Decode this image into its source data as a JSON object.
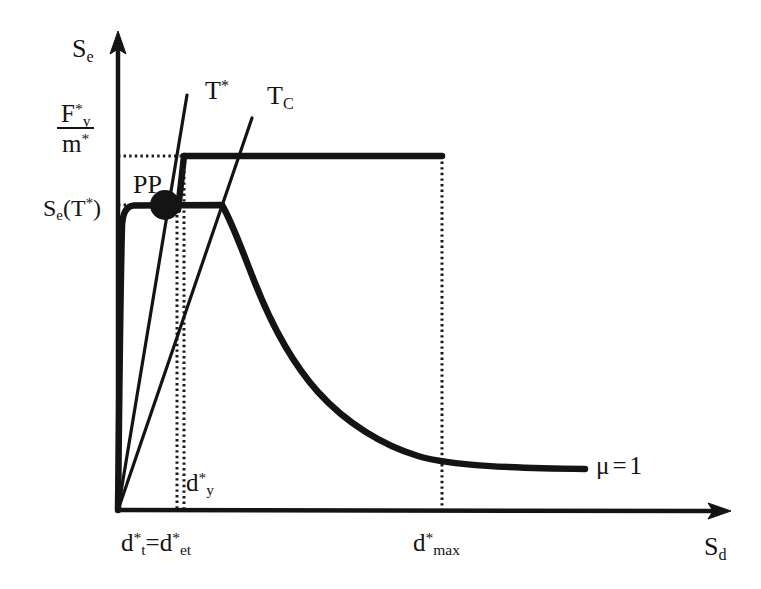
{
  "figure": {
    "background_color": "#ffffff",
    "line_color": "#141414",
    "axes": {
      "y_axis_label": "S_e",
      "x_axis_label": "S_d",
      "origin_px": {
        "x": 118,
        "y": 510
      },
      "y_axis_top_px": 33,
      "x_axis_right_px": 730
    },
    "labels": {
      "y_axis": {
        "base": "S",
        "sub": "e"
      },
      "x_axis": {
        "base": "S",
        "sub": "d"
      },
      "fy_over_m": {
        "numerator": {
          "base": "F",
          "sub": "y",
          "sup": "*"
        },
        "denominator": {
          "base": "m",
          "sup": "*"
        }
      },
      "se_of_tstar": {
        "text": "S_e(T*)",
        "base": "S",
        "sub": "e",
        "arg_base": "T",
        "arg_sup": "*"
      },
      "period_tstar": {
        "base": "T",
        "sup": "*"
      },
      "period_tc": {
        "base": "T",
        "sub": "C"
      },
      "performance_point": "PP",
      "d_y": {
        "base": "d",
        "sub": "y",
        "sup": "*"
      },
      "d_t_eq_d_et": {
        "left_base": "d",
        "left_sub": "t",
        "left_sup": "*",
        "eq": "=",
        "right_base": "d",
        "right_sub": "et",
        "right_sup": "*"
      },
      "d_max": {
        "base": "d",
        "sub": "max",
        "sup": "*"
      },
      "ductility": {
        "symbol": "μ",
        "relation": "=",
        "value": "1"
      }
    }
  },
  "chart_data": {
    "type": "line",
    "title": "",
    "xlabel": "S_d",
    "ylabel": "S_e",
    "grid": false,
    "legend": "none",
    "axis_ranges": {
      "x_px": [
        118,
        730
      ],
      "y_px": [
        510,
        33
      ]
    },
    "annotations": [
      {
        "name": "performance-point",
        "label": "PP",
        "x_px": 164,
        "y_px": 205,
        "marker": "filled-circle",
        "radius_px": 15
      },
      {
        "name": "ductility-label",
        "label": "μ = 1",
        "x_px": 596,
        "y_px": 453
      },
      {
        "name": "period-line-label-tstar",
        "label": "T*",
        "x_px": 205,
        "y_px": 78
      },
      {
        "name": "period-line-label-tc",
        "label": "TC",
        "x_px": 267,
        "y_px": 83
      }
    ],
    "reference_values_px": {
      "fy_over_m_level_y": 156,
      "se_tstar_level_y": 205,
      "d_t_eq_det_x": 177,
      "d_y_x": 184,
      "d_max_x": 442,
      "plateau_end_x": 222,
      "yield_knee_x": 124
    },
    "series": [
      {
        "name": "elastic-demand-spectrum-mu-1",
        "style": "thick-solid",
        "width_px": 6,
        "description": "Elastic acceleration demand spectrum for mu = 1: rises to the constant-acceleration plateau at Fy*/m*, then decays hyperbolically and flattens toward the right.",
        "points_px": [
          [
            118,
            510
          ],
          [
            120,
            330
          ],
          [
            122,
            230
          ],
          [
            124,
            170
          ],
          [
            130,
            157
          ],
          [
            160,
            156
          ],
          [
            230,
            156
          ],
          [
            300,
            156
          ],
          [
            380,
            156
          ],
          [
            442,
            156
          ]
        ]
      },
      {
        "name": "inelastic-demand-spectrum",
        "style": "thick-solid",
        "width_px": 6,
        "description": "Capacity (bilinear) / reduced demand curve: steep initial stiffness from origin to yield, constant plateau at S_e(T*), then descending branch decaying to a flat tail.",
        "points_px": [
          [
            118,
            510
          ],
          [
            121,
            380
          ],
          [
            123,
            280
          ],
          [
            126,
            215
          ],
          [
            132,
            206
          ],
          [
            160,
            205
          ],
          [
            200,
            205
          ],
          [
            222,
            205
          ],
          [
            240,
            245
          ],
          [
            258,
            290
          ],
          [
            278,
            330
          ],
          [
            300,
            366
          ],
          [
            325,
            397
          ],
          [
            352,
            421
          ],
          [
            382,
            441
          ],
          [
            412,
            455
          ],
          [
            442,
            463
          ],
          [
            480,
            466
          ],
          [
            520,
            467
          ],
          [
            560,
            468
          ],
          [
            585,
            468
          ]
        ]
      },
      {
        "name": "period-line-T-star",
        "style": "thin-solid-radial",
        "width_px": 3,
        "description": "Radial line of constant period T* from the origin through the performance point PP.",
        "points_px": [
          [
            118,
            510
          ],
          [
            164,
            205
          ],
          [
            186,
            96
          ]
        ]
      },
      {
        "name": "period-line-T-C",
        "style": "thin-solid-radial",
        "width_px": 3,
        "description": "Radial line of constant corner period TC from the origin through the plateau end.",
        "points_px": [
          [
            118,
            510
          ],
          [
            222,
            205
          ],
          [
            251,
            120
          ]
        ]
      }
    ],
    "dotted_guides": [
      {
        "name": "fy-over-m-horizontal",
        "orientation": "horizontal",
        "y_px": 156,
        "from_x_px": 118,
        "to_x_px": 186
      },
      {
        "name": "se-tstar-horizontal",
        "orientation": "horizontal",
        "y_px": 205,
        "from_x_px": 118,
        "to_x_px": 130
      },
      {
        "name": "d-t-et-vertical",
        "orientation": "vertical",
        "x_px": 177,
        "from_y_px": 215,
        "to_y_px": 510
      },
      {
        "name": "d-y-vertical",
        "orientation": "vertical",
        "x_px": 184,
        "from_y_px": 160,
        "to_y_px": 510
      },
      {
        "name": "d-max-vertical",
        "orientation": "vertical",
        "x_px": 442,
        "from_y_px": 156,
        "to_y_px": 510
      }
    ]
  }
}
